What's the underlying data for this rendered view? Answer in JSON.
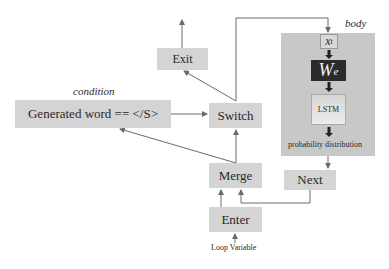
{
  "diagram": {
    "condition_label": "condition",
    "body_label": "body",
    "nodes": {
      "exit": "Exit",
      "condition_expr": "Generated word == </S>",
      "switch": "Switch",
      "merge": "Merge",
      "enter": "Enter",
      "next": "Next",
      "xt_main": "x",
      "xt_sub": "t",
      "we_main": "W",
      "we_sub": "e",
      "lstm": "LSTM",
      "prob_dist": "probability distribution"
    },
    "input_label": "Loop Variable",
    "colors": {
      "node_fill": "#d4d4d4",
      "body_fill": "#c8c8c8",
      "we_fill": "#2b2b2b",
      "lstm_fill": "#e0e0e0",
      "wire": "#6a6a6a",
      "dark_arrow": "#222222"
    }
  }
}
